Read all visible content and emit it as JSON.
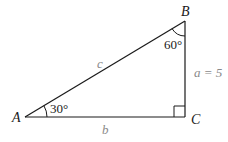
{
  "diagram": {
    "type": "right-triangle",
    "vertices": {
      "A": {
        "label": "A"
      },
      "B": {
        "label": "B"
      },
      "C": {
        "label": "C"
      }
    },
    "sides": {
      "hypotenuse": {
        "label": "c"
      },
      "horizontal": {
        "label": "b"
      },
      "vertical": {
        "label": "a = 5"
      }
    },
    "angles": {
      "A": {
        "label": "30°"
      },
      "B": {
        "label": "60°"
      },
      "C": {
        "marker": "right-angle"
      }
    },
    "colors": {
      "lines": "#1a1a1a",
      "side_labels": "#8a8a8a",
      "vertex_labels": "#1a1a1a"
    }
  }
}
